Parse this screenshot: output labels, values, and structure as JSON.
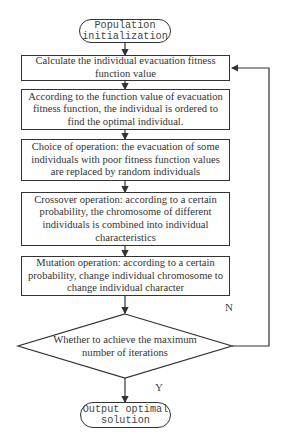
{
  "diagram": {
    "type": "flowchart",
    "start": {
      "label": "Population initialization"
    },
    "steps": [
      {
        "id": "fitness",
        "label": "Calculate the individual evacuation fitness function value"
      },
      {
        "id": "sort",
        "label": "According to the function value of evacuation fitness function, the individual is ordered to find the optimal individual."
      },
      {
        "id": "selection",
        "label": "Choice of operation: the evacuation of some individuals with poor fitness function values are replaced by random individuals"
      },
      {
        "id": "crossover",
        "label": "Crossover operation: according to a certain probability, the chromosome of different individuals is combined into individual characteristics"
      },
      {
        "id": "mutation",
        "label": "Mutation operation: according to a certain probability, change individual chromosome to change individual character"
      }
    ],
    "decision": {
      "label": "Whether to achieve the maximum number of iterations",
      "no_label": "N",
      "yes_label": "Y"
    },
    "end": {
      "label": "Output optimal solution"
    },
    "edges": [
      {
        "from": "start",
        "to": "fitness"
      },
      {
        "from": "fitness",
        "to": "sort"
      },
      {
        "from": "sort",
        "to": "selection"
      },
      {
        "from": "selection",
        "to": "crossover"
      },
      {
        "from": "crossover",
        "to": "mutation"
      },
      {
        "from": "mutation",
        "to": "decision"
      },
      {
        "from": "decision",
        "to": "fitness",
        "label": "N"
      },
      {
        "from": "decision",
        "to": "end",
        "label": "Y"
      }
    ],
    "colors": {
      "stroke": "#333333",
      "background": "#ffffff",
      "text": "#333333"
    }
  }
}
